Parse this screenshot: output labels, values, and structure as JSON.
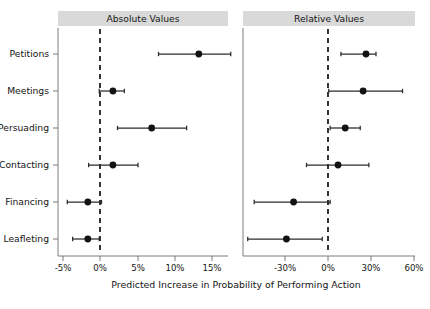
{
  "figure": {
    "xlabel": "Predicted Increase in Probability of Performing Action",
    "panels": [
      {
        "key": "absolute",
        "title": "Absolute Values"
      },
      {
        "key": "relative",
        "title": "Relative Values"
      }
    ],
    "categories": [
      "Petitions",
      "Meetings",
      "Persuading",
      "Contacting",
      "Financing",
      "Leafleting"
    ],
    "ticks_absolute": [
      "-5%",
      "0%",
      "5%",
      "10%",
      "15%"
    ],
    "ticks_relative": [
      "-30%",
      "0%",
      "30%",
      "60%"
    ],
    "colors": {
      "strip_background": "#d9d9d9",
      "point": "#121212",
      "interval": "#2b2b2b",
      "zero_reference": "#111111",
      "axis": "#6e6e6e"
    }
  },
  "chart_data": {
    "type": "scatter",
    "title": "",
    "subtitle": "",
    "xlabel": "Predicted Increase in Probability of Performing Action",
    "ylabel": "",
    "grid": false,
    "legend": false,
    "orientation": "horizontal",
    "marker": "filled-circle with horizontal confidence interval",
    "reference_line": {
      "value": 0,
      "style": "dashed",
      "label": "0%"
    },
    "categories": [
      "Petitions",
      "Meetings",
      "Persuading",
      "Contacting",
      "Financing",
      "Leafleting"
    ],
    "panels": [
      {
        "name": "Absolute Values",
        "xlim": [
          -6.5,
          18.5
        ],
        "xticks": [
          -5,
          0,
          5,
          10,
          15
        ],
        "xticklabels": [
          "-5%",
          "0%",
          "5%",
          "10%",
          "15%"
        ],
        "units": "percentage points",
        "points": [
          {
            "category": "Petitions",
            "estimate": 13.0,
            "ci_low": 7.7,
            "ci_high": 17.2
          },
          {
            "category": "Meetings",
            "estimate": 1.7,
            "ci_low": -0.1,
            "ci_high": 3.2
          },
          {
            "category": "Persuading",
            "estimate": 6.8,
            "ci_low": 2.3,
            "ci_high": 11.4
          },
          {
            "category": "Contacting",
            "estimate": 1.7,
            "ci_low": -1.5,
            "ci_high": 5.0
          },
          {
            "category": "Financing",
            "estimate": -1.6,
            "ci_low": -4.3,
            "ci_high": 0.2
          },
          {
            "category": "Leafleting",
            "estimate": -1.6,
            "ci_low": -3.6,
            "ci_high": -0.1
          }
        ]
      },
      {
        "name": "Relative Values",
        "xlim": [
          -58,
          62
        ],
        "xticks": [
          -30,
          0,
          30,
          60
        ],
        "xticklabels": [
          "-30%",
          "0%",
          "30%",
          "60%"
        ],
        "units": "percent change",
        "points": [
          {
            "category": "Petitions",
            "estimate": 26.5,
            "ci_low": 9.0,
            "ci_high": 33.5
          },
          {
            "category": "Meetings",
            "estimate": 24.5,
            "ci_low": 0.5,
            "ci_high": 52.0
          },
          {
            "category": "Persuading",
            "estimate": 12.0,
            "ci_low": 1.5,
            "ci_high": 22.5
          },
          {
            "category": "Contacting",
            "estimate": 7.0,
            "ci_low": -15.0,
            "ci_high": 28.5
          },
          {
            "category": "Financing",
            "estimate": -24.0,
            "ci_low": -51.5,
            "ci_high": 1.5
          },
          {
            "category": "Leafleting",
            "estimate": -29.0,
            "ci_low": -56.0,
            "ci_high": -4.0
          }
        ]
      }
    ]
  }
}
